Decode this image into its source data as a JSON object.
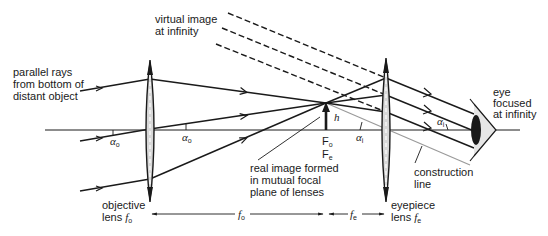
{
  "diagram": {
    "labels": {
      "virtual_image_line1": "virtual image",
      "virtual_image_line2": "at infinity",
      "parallel_rays_line1": "parallel rays",
      "parallel_rays_line2": "from bottom of",
      "parallel_rays_line3": "distant object",
      "eye_line1": "eye",
      "eye_line2": "focused",
      "eye_line3": "at infinity",
      "real_image_line1": "real image formed",
      "real_image_line2": "in mutual focal",
      "real_image_line3": "plane of lenses",
      "construction_line1": "construction",
      "construction_line2": "line",
      "objective_line1": "objective",
      "objective_line2": "lens ",
      "eyepiece_line1": "eyepiece",
      "eyepiece_line2": "lens "
    },
    "symbols": {
      "alpha": "α",
      "sub_o": "o",
      "sub_i": "i",
      "sub_e": "e",
      "h": "h",
      "F": "F",
      "f": "f"
    },
    "components": [
      "objective lens",
      "eyepiece lens",
      "eye",
      "optical axis",
      "real image arrow",
      "construction line"
    ],
    "dimensions": [
      {
        "label": "f_o",
        "from": "objective lens",
        "to": "focal plane"
      },
      {
        "label": "f_e",
        "from": "focal plane",
        "to": "eyepiece lens"
      }
    ],
    "colors": {
      "ink": "#1a1a1a",
      "construction": "#9a9a9a",
      "lens_fill": "#d8d8d8",
      "eye_fill": "#e6e6e6"
    }
  }
}
